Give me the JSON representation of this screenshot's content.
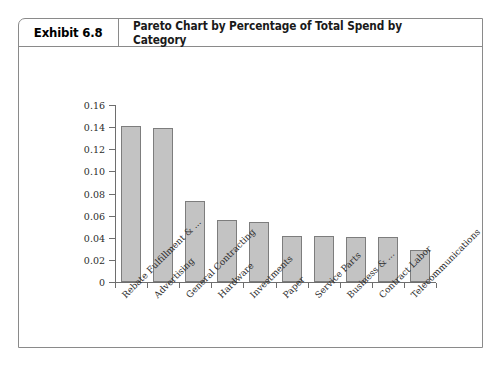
{
  "exhibit": {
    "number_label": "Exhibit 6.8",
    "title": "Pareto Chart by Percentage of Total Spend by Category"
  },
  "chart_data": {
    "type": "bar",
    "title": "Pareto Chart by Percentage of Total Spend by Category",
    "xlabel": "",
    "ylabel": "",
    "ylim": [
      0,
      0.16
    ],
    "grid": false,
    "legend": "none",
    "y_ticks": [
      "0",
      "0.02",
      "0.04",
      "0.06",
      "0.08",
      "0.10",
      "0.12",
      "0.14",
      "0.16"
    ],
    "y_tick_values": [
      0,
      0.02,
      0.04,
      0.06,
      0.08,
      0.1,
      0.12,
      0.14,
      0.16
    ],
    "categories": [
      "Rebate Fulfillment & ...",
      "Advertising",
      "General Contracting",
      "Hardware",
      "Investments",
      "Paper",
      "Service Parts",
      "Business & ...",
      "Contract Labor",
      "Telecommunications"
    ],
    "values": [
      0.141,
      0.139,
      0.073,
      0.056,
      0.054,
      0.042,
      0.042,
      0.041,
      0.041,
      0.029
    ],
    "bar_color": "#c3c3c3",
    "bar_border_color": "#7d7d7d",
    "axis_color": "#6e6e6e"
  }
}
